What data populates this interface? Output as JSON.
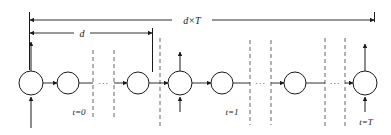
{
  "figure": {
    "stroke_color": "#1a1a1a",
    "dashed_color": "#555555",
    "background": "#ffffff"
  },
  "dimensions": [
    {
      "id": "dxT",
      "label": "d×T",
      "span": "full"
    },
    {
      "id": "d",
      "label": "d",
      "span": "first-block"
    }
  ],
  "time_labels": [
    {
      "id": "t0",
      "label": "t=0"
    },
    {
      "id": "t1",
      "label": "t=1"
    },
    {
      "id": "tT",
      "label": "t=T"
    }
  ],
  "ellipses": [
    {
      "id": "e1",
      "glyph": "···"
    },
    {
      "id": "e2",
      "glyph": "···"
    },
    {
      "id": "e3",
      "glyph": "···"
    }
  ],
  "nodes": [
    {
      "id": "n1",
      "cx": 31,
      "cy": 83,
      "r": 12,
      "arrow_up_top": true,
      "arrow_up_bottom": true
    },
    {
      "id": "n2",
      "cx": 68,
      "cy": 83,
      "r": 11,
      "arrow_up_top": false,
      "arrow_up_bottom": false
    },
    {
      "id": "n3",
      "cx": 138,
      "cy": 83,
      "r": 11,
      "arrow_up_top": false,
      "arrow_up_bottom": false
    },
    {
      "id": "n4",
      "cx": 180,
      "cy": 83,
      "r": 12,
      "arrow_up_top": true,
      "arrow_up_bottom": true
    },
    {
      "id": "n5",
      "cx": 222,
      "cy": 83,
      "r": 11,
      "arrow_up_top": false,
      "arrow_up_bottom": false
    },
    {
      "id": "n6",
      "cx": 295,
      "cy": 83,
      "r": 11,
      "arrow_up_top": false,
      "arrow_up_bottom": false
    },
    {
      "id": "n7",
      "cx": 365,
      "cy": 83,
      "r": 12,
      "arrow_up_top": true,
      "arrow_up_bottom": true
    }
  ],
  "separators": [
    {
      "id": "s1",
      "x": 93
    },
    {
      "id": "s2",
      "x": 114
    },
    {
      "id": "s3",
      "x": 160
    },
    {
      "id": "s4",
      "x": 250
    },
    {
      "id": "s5",
      "x": 271
    },
    {
      "id": "s6",
      "x": 325
    },
    {
      "id": "s7",
      "x": 345
    }
  ]
}
